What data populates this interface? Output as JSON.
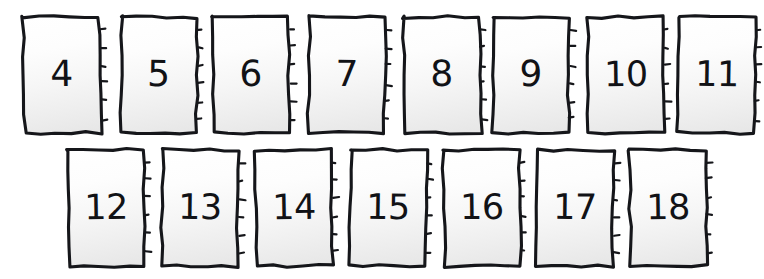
{
  "board": {
    "title": "Number card sequence",
    "background_color": "#ffffff",
    "ink_color": "#15161a",
    "card_face_top_color": "#ffffff",
    "card_face_bottom_color": "#e6e6e6",
    "card_count": 15,
    "rows": [
      {
        "name": "row-1",
        "top": 17,
        "card_width": 76,
        "card_height": 116,
        "cards": [
          {
            "label": "4",
            "left": 24,
            "rotate": -0.4,
            "skew": 0.6
          },
          {
            "label": "5",
            "left": 121,
            "rotate": 0.5,
            "skew": -0.5
          },
          {
            "label": "6",
            "left": 213,
            "rotate": -0.3,
            "skew": 0.4
          },
          {
            "label": "7",
            "left": 309,
            "rotate": 0.4,
            "skew": -0.3
          },
          {
            "label": "8",
            "left": 404,
            "rotate": -0.5,
            "skew": 0.5
          },
          {
            "label": "9",
            "left": 493,
            "rotate": 0.3,
            "skew": -0.4
          },
          {
            "label": "10",
            "left": 588,
            "rotate": -0.4,
            "skew": 0.3
          },
          {
            "label": "11",
            "left": 679,
            "rotate": 0.5,
            "skew": -0.5
          }
        ]
      },
      {
        "name": "row-2",
        "top": 150,
        "card_width": 76,
        "card_height": 116,
        "cards": [
          {
            "label": "12",
            "left": 68,
            "rotate": -0.4,
            "skew": 0.5
          },
          {
            "label": "13",
            "left": 162,
            "rotate": 0.4,
            "skew": -0.4
          },
          {
            "label": "14",
            "left": 256,
            "rotate": -0.5,
            "skew": 0.6
          },
          {
            "label": "15",
            "left": 350,
            "rotate": 0.5,
            "skew": -0.5
          },
          {
            "label": "16",
            "left": 444,
            "rotate": -0.3,
            "skew": 0.4
          },
          {
            "label": "17",
            "left": 537,
            "rotate": 0.4,
            "skew": -0.3
          },
          {
            "label": "18",
            "left": 630,
            "rotate": -0.4,
            "skew": 0.5
          }
        ]
      }
    ]
  }
}
